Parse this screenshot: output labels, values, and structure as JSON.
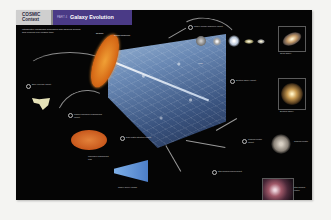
{
  "header": {
    "section_tab": "COSMIC Context",
    "section_tab_line1": "COSMIC",
    "section_tab_line2": "Context",
    "part_label": "PART 4",
    "title": "Galaxy Evolution"
  },
  "colors": {
    "header_purple": "#4a3a86",
    "tab_grey": "#cfcfcf",
    "page_background": "#050505",
    "cmb_orange": "#d86c18",
    "cone_blue": "#6e8fbd"
  },
  "intro_text": "Introductory paragraph describing how galaxies formed and evolved over cosmic time.",
  "figure": {
    "cone_labels": [
      "Big Bang",
      "Cosmic background",
      "Today"
    ],
    "callouts": [
      {
        "number": "1",
        "text": "Early universe callout"
      },
      {
        "number": "2",
        "text": "Cosmic microwave background callout"
      },
      {
        "number": "3",
        "text": "Dark matter structure callout"
      },
      {
        "number": "4",
        "text": "Galaxy merger sequence callout"
      },
      {
        "number": "5",
        "text": "Elliptical galaxy callout"
      },
      {
        "number": "6",
        "text": "Globular cluster callout"
      },
      {
        "number": "7",
        "text": "Star-forming nebula callout"
      }
    ],
    "panels": [
      {
        "name": "spiral-galaxy",
        "caption": "Spiral galaxy"
      },
      {
        "name": "elliptical-galaxy",
        "caption": "Elliptical galaxy"
      },
      {
        "name": "globular-cluster",
        "caption": "Globular cluster"
      },
      {
        "name": "nebula",
        "caption": "Star-forming region"
      },
      {
        "name": "cmb-map",
        "caption": "Microwave background map"
      },
      {
        "name": "simulation-wedge",
        "caption": "Galaxy survey wedge"
      }
    ]
  }
}
